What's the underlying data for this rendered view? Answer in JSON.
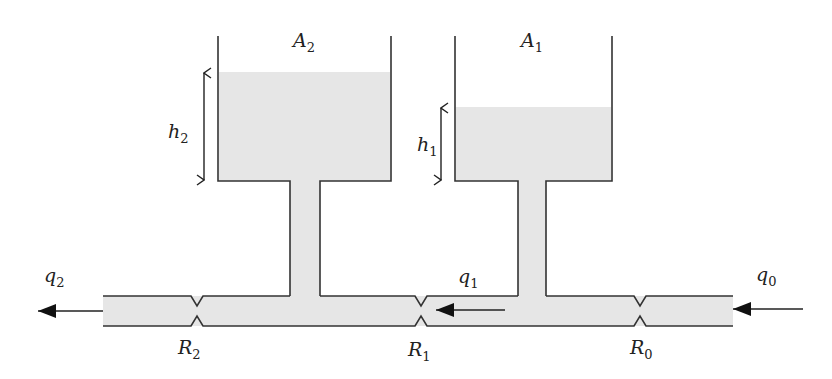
{
  "diagram": {
    "colors": {
      "fluid": "#e6e6e6",
      "line": "#333333",
      "background": "#ffffff"
    },
    "tanks": [
      {
        "id": "tank-2",
        "area_label": "A",
        "area_sub": "2",
        "level_label": "h",
        "level_sub": "2"
      },
      {
        "id": "tank-1",
        "area_label": "A",
        "area_sub": "1",
        "level_label": "h",
        "level_sub": "1"
      }
    ],
    "valves": [
      {
        "id": "R2",
        "label": "R",
        "sub": "2"
      },
      {
        "id": "R1",
        "label": "R",
        "sub": "1"
      },
      {
        "id": "R0",
        "label": "R",
        "sub": "0"
      }
    ],
    "flows": [
      {
        "id": "q2",
        "label": "q",
        "sub": "2",
        "direction": "left",
        "position": "outlet"
      },
      {
        "id": "q1",
        "label": "q",
        "sub": "1",
        "direction": "left",
        "position": "between tanks"
      },
      {
        "id": "q0",
        "label": "q",
        "sub": "0",
        "direction": "left",
        "position": "inlet"
      }
    ]
  }
}
